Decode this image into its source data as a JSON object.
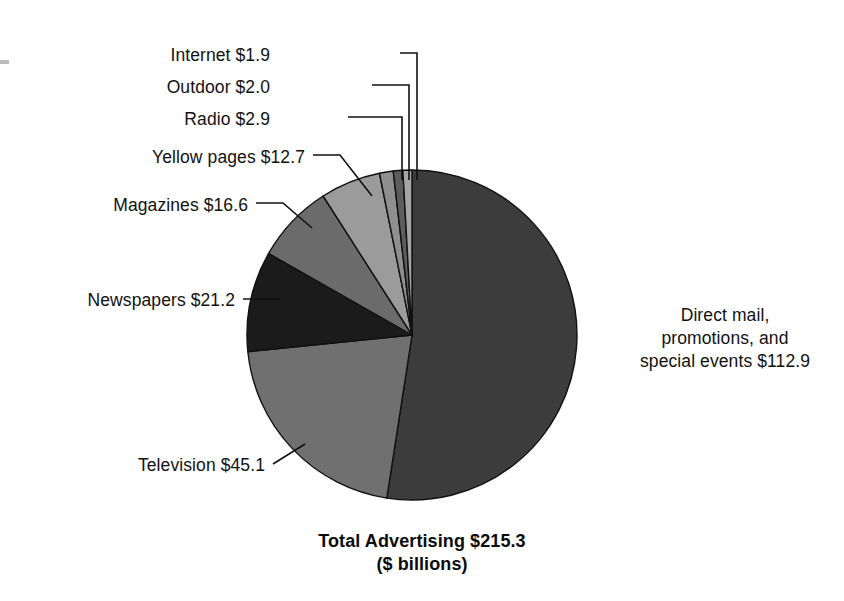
{
  "chart_data": {
    "type": "pie",
    "title": "Total Advertising $215.3",
    "subtitle": "($ billions)",
    "units": "$ billions",
    "total": 215.3,
    "legend_position": "callout-labels",
    "start_angle_deg": 0,
    "direction": "clockwise",
    "categories": [
      "Direct mail, promotions, and special events",
      "Television",
      "Newspapers",
      "Magazines",
      "Yellow pages",
      "Radio",
      "Outdoor",
      "Internet"
    ],
    "values": [
      112.9,
      45.1,
      21.2,
      16.6,
      12.7,
      2.9,
      2.0,
      1.9
    ],
    "colors": [
      "#3c3c3c",
      "#707070",
      "#1b1b1b",
      "#6b6b6b",
      "#9b9b9b",
      "#8f8f8f",
      "#5d5d5d",
      "#a5a5a5"
    ],
    "slices": [
      {
        "label": "Direct mail, promotions, and special events",
        "value": 112.9,
        "display": "Direct mail, promotions, and special events $112.9",
        "color": "#3c3c3c"
      },
      {
        "label": "Television",
        "value": 45.1,
        "display": "Television $45.1",
        "color": "#707070"
      },
      {
        "label": "Newspapers",
        "value": 21.2,
        "display": "Newspapers $21.2",
        "color": "#1b1b1b"
      },
      {
        "label": "Magazines",
        "value": 16.6,
        "display": "Magazines $16.6",
        "color": "#6b6b6b"
      },
      {
        "label": "Yellow pages",
        "value": 12.7,
        "display": "Yellow pages $12.7",
        "color": "#9b9b9b"
      },
      {
        "label": "Radio",
        "value": 2.9,
        "display": "Radio $2.9",
        "color": "#8f8f8f"
      },
      {
        "label": "Outdoor",
        "value": 2.0,
        "display": "Outdoor $2.0",
        "color": "#5d5d5d"
      },
      {
        "label": "Internet",
        "value": 1.9,
        "display": "Internet $1.9",
        "color": "#a5a5a5"
      }
    ]
  },
  "labels": {
    "internet": "Internet $1.9",
    "outdoor": "Outdoor $2.0",
    "radio": "Radio $2.9",
    "yellow_pages": "Yellow pages $12.7",
    "magazines": "Magazines $16.6",
    "newspapers": "Newspapers $21.2",
    "television": "Television $45.1",
    "direct_mail_line1": "Direct mail,",
    "direct_mail_line2": "promotions, and",
    "direct_mail_line3": "special events $112.9"
  },
  "title": {
    "line1": "Total Advertising $215.3",
    "line2": "($ billions)"
  }
}
